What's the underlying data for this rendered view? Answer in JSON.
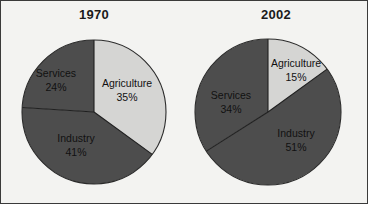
{
  "figure": {
    "background_color": "#f3f3f1",
    "border_color": "#3a3a3a"
  },
  "palette": {
    "light_slice": "#d5d5d3",
    "dark_slice": "#4d4d4d",
    "divider": "#1f1f1f",
    "outline": "#2b2b2b",
    "label_text": "#111111",
    "title_text": "#1a1a1a"
  },
  "chart_data": [
    {
      "type": "pie",
      "title": "1970",
      "labels": [
        "Agriculture",
        "Industry",
        "Services"
      ],
      "values": [
        35,
        41,
        24
      ],
      "value_labels": [
        "35%",
        "41%",
        "24%"
      ],
      "colors": [
        "#d5d5d3",
        "#4d4d4d",
        "#4d4d4d"
      ],
      "start_angle_deg": 0,
      "direction": "clockwise",
      "center": [
        93,
        111
      ],
      "radius": 72,
      "legend": "none",
      "grid": false,
      "label_positions": [
        {
          "label_x": 126,
          "label_y": 86,
          "value_x": 126,
          "value_y": 100
        },
        {
          "label_x": 75,
          "label_y": 141,
          "value_x": 75,
          "value_y": 155
        },
        {
          "label_x": 55,
          "label_y": 76,
          "value_x": 55,
          "value_y": 90
        }
      ]
    },
    {
      "type": "pie",
      "title": "2002",
      "labels": [
        "Agriculture",
        "Industry",
        "Services"
      ],
      "values": [
        15,
        51,
        34
      ],
      "value_labels": [
        "15%",
        "51%",
        "34%"
      ],
      "colors": [
        "#d5d5d3",
        "#4d4d4d",
        "#4d4d4d"
      ],
      "start_angle_deg": 0,
      "direction": "clockwise",
      "center": [
        85,
        111
      ],
      "radius": 73,
      "legend": "none",
      "grid": false,
      "label_positions": [
        {
          "label_x": 113,
          "label_y": 66,
          "value_x": 113,
          "value_y": 80
        },
        {
          "label_x": 113,
          "label_y": 136,
          "value_x": 113,
          "value_y": 150
        },
        {
          "label_x": 48,
          "label_y": 98,
          "value_x": 48,
          "value_y": 112
        }
      ]
    }
  ]
}
